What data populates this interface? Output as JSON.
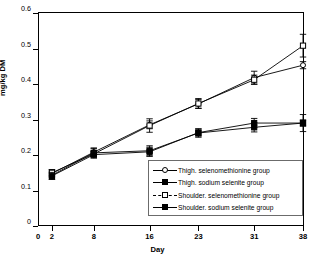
{
  "title_strip": "",
  "axes": {
    "ylabel": "mg/kg DM",
    "xlabel": "Day",
    "yticks": [
      "0",
      "0.1",
      "0.2",
      "0.3",
      "0.4",
      "0.5",
      "0.6"
    ],
    "xticks": [
      "0",
      "2",
      "8",
      "16",
      "23",
      "31",
      "38"
    ]
  },
  "legend": {
    "items": [
      {
        "label": "Thigh. selenomethionine group",
        "marker": "circ-open",
        "line": "solid"
      },
      {
        "label": "Thigh. sodium selenite group",
        "marker": "sq-fill",
        "line": "solid"
      },
      {
        "label": "Shoulder. selenomethionine group",
        "marker": "sq-open",
        "line": "dash"
      },
      {
        "label": "Shoulder. sodium selenite  group",
        "marker": "sq-fill",
        "line": "solid"
      }
    ]
  },
  "chart_data": {
    "type": "line",
    "title": "",
    "xlabel": "Day",
    "ylabel": "mg/kg DM",
    "ylim": [
      0,
      0.6
    ],
    "grid": false,
    "legend_position": "inside-lower-right",
    "categories": [
      "2",
      "8",
      "16",
      "23",
      "31",
      "38"
    ],
    "x_positions": [
      2,
      8,
      16,
      23,
      31,
      38
    ],
    "series": [
      {
        "name": "Thigh. selenomethionine group",
        "marker": "circ-open",
        "values": [
          0.148,
          0.208,
          0.285,
          0.344,
          0.418,
          0.453
        ],
        "errors": [
          0.01,
          0.012,
          0.011,
          0.012,
          0.018,
          0.01
        ]
      },
      {
        "name": "Thigh. sodium selenite group",
        "marker": "sq-fill",
        "values": [
          0.143,
          0.206,
          0.212,
          0.262,
          0.278,
          0.29
        ],
        "errors": [
          0.011,
          0.012,
          0.014,
          0.012,
          0.013,
          0.009
        ]
      },
      {
        "name": "Shoulder. selenomethionine group",
        "marker": "sq-open",
        "values": [
          0.15,
          0.203,
          0.283,
          0.345,
          0.412,
          0.508
        ],
        "errors": [
          0.009,
          0.008,
          0.019,
          0.014,
          0.013,
          0.032
        ]
      },
      {
        "name": "Shoulder. sodium selenite  group",
        "marker": "sq-fill",
        "values": [
          0.141,
          0.201,
          0.209,
          0.263,
          0.29,
          0.29
        ],
        "errors": [
          0.01,
          0.01,
          0.013,
          0.01,
          0.013,
          0.024
        ]
      }
    ]
  }
}
